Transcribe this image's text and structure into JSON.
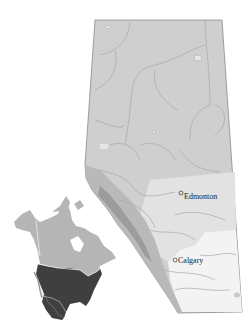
{
  "map": {
    "title": "Alberta",
    "colors": {
      "background": "#ffffff",
      "boreal": "#cfcfcf",
      "parkland": "#e2e2e2",
      "grassland": "#f3f3f3",
      "foothills": "#b9b9b9",
      "rockies": "#9c9c9c",
      "border": "#8a8a8a",
      "rivers": "#a8a8a8"
    },
    "cities": [
      {
        "name": "Edmonton",
        "x": 181,
        "y": 193
      },
      {
        "name": "Calgary",
        "x": 174,
        "y": 260
      }
    ]
  },
  "inset": {
    "title": "North America locator",
    "colors": {
      "canada": "#b5b5b5",
      "usa": "#3f3f3f",
      "borders": "#ffffff"
    }
  }
}
